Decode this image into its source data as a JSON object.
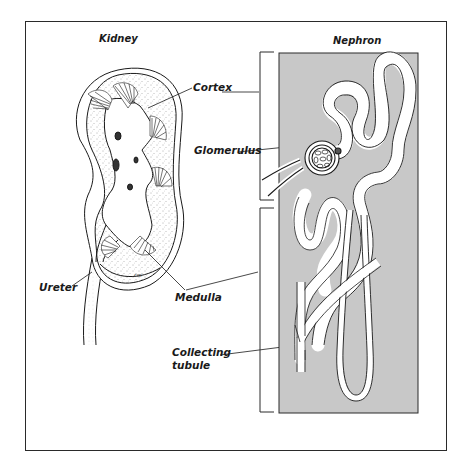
{
  "figure": {
    "panels": [
      {
        "id": "kidney",
        "title": "Kidney"
      },
      {
        "id": "nephron",
        "title": "Nephron"
      }
    ],
    "labels": {
      "cortex": "Cortex",
      "glomerulus": "Glomerulus",
      "ureter": "Ureter",
      "medulla": "Medulla",
      "collecting_tubule_line1": "Collecting",
      "collecting_tubule_line2": "tubule"
    },
    "colors": {
      "frame": "#2a2a2a",
      "nephron_background": "#c8c8c8",
      "tubule_fill": "#ffffff",
      "ink": "#1a1a1a"
    }
  }
}
